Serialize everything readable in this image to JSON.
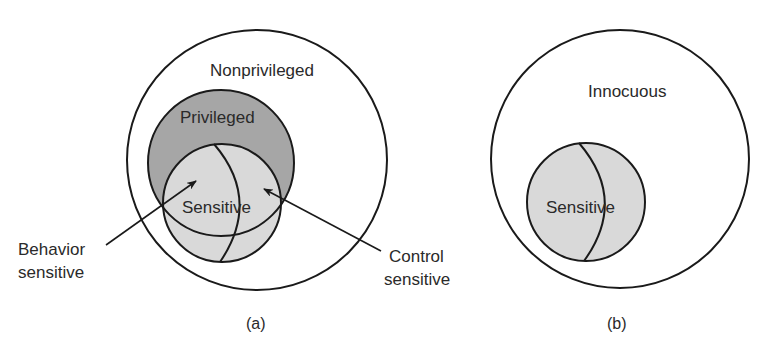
{
  "panel_a": {
    "caption": "(a)",
    "outer_label": "Nonprivileged",
    "privileged_label": "Privileged",
    "sensitive_label": "Sensitive",
    "behavior_label_line1": "Behavior",
    "behavior_label_line2": "sensitive",
    "control_label_line1": "Control",
    "control_label_line2": "sensitive"
  },
  "panel_b": {
    "caption": "(b)",
    "outer_label": "Innocuous",
    "sensitive_label": "Sensitive"
  },
  "colors": {
    "stroke": "#1a1a1a",
    "privileged_fill": "#a6a6a6",
    "sensitive_fill": "#d9d9d9",
    "background": "#ffffff"
  }
}
